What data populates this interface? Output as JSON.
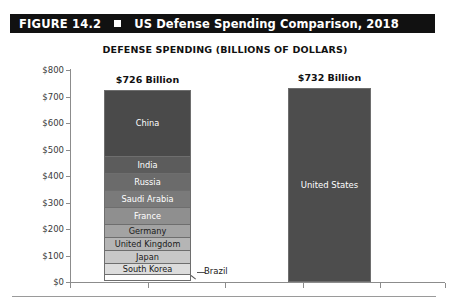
{
  "figure": {
    "number_label": "FIGURE 14.2",
    "bullet_icon": "black-square-bullet",
    "title": "US Defense Spending Comparison, 2018"
  },
  "chart_title": "DEFENSE SPENDING (BILLIONS OF DOLLARS)",
  "axis": {
    "y_ticks": [
      "$800",
      "$700",
      "$600",
      "$500",
      "$400",
      "$300",
      "$200",
      "$100",
      "$0"
    ]
  },
  "bars": {
    "left": {
      "total_label": "$726 Billion"
    },
    "right": {
      "total_label": "$732 Billion"
    }
  },
  "callout": {
    "brazil_label": "Brazil"
  },
  "chart_data": {
    "type": "bar",
    "title": "DEFENSE SPENDING (BILLIONS OF DOLLARS)",
    "subtitle": "US Defense Spending Comparison, 2018",
    "xlabel": "",
    "ylabel": "Billions of dollars",
    "ylim": [
      0,
      800
    ],
    "y_ticks": [
      0,
      100,
      200,
      300,
      400,
      500,
      600,
      700,
      800
    ],
    "grid": false,
    "legend": "none",
    "categories": [
      "Top 9 countries after the US (stacked)",
      "United States"
    ],
    "totals": [
      726,
      732
    ],
    "total_labels": [
      "$726 Billion",
      "$732 Billion"
    ],
    "stacked_bar": {
      "category": "Top 9 countries after the US (stacked)",
      "total": 726,
      "segments": [
        {
          "name": "China",
          "value": 250,
          "color": "#4a4a4a",
          "label_color": "#ffffff"
        },
        {
          "name": "India",
          "value": 66,
          "color": "#5c5c5c",
          "label_color": "#ffffff"
        },
        {
          "name": "Russia",
          "value": 61,
          "color": "#6b6b6b",
          "label_color": "#ffffff"
        },
        {
          "name": "Saudi Arabia",
          "value": 67,
          "color": "#7a7a7a",
          "label_color": "#ffffff"
        },
        {
          "name": "France",
          "value": 63,
          "color": "#8f8f8f",
          "label_color": "#ffffff"
        },
        {
          "name": "Germany",
          "value": 49,
          "color": "#a3a3a3",
          "label_color": "#1a1a1a"
        },
        {
          "name": "United Kingdom",
          "value": 50,
          "color": "#b5b5b5",
          "label_color": "#1a1a1a"
        },
        {
          "name": "Japan",
          "value": 47,
          "color": "#c8c8c8",
          "label_color": "#1a1a1a"
        },
        {
          "name": "South Korea",
          "value": 43,
          "color": "#dcdcdc",
          "label_color": "#1a1a1a"
        },
        {
          "name": "Brazil",
          "value": 28,
          "color": "#fdfdfd",
          "label_color": "#1a1a1a"
        }
      ]
    },
    "single_bar": {
      "category": "United States",
      "name": "United States",
      "value": 732,
      "color": "#4d4d4d",
      "label_color": "#ffffff"
    },
    "annotations": [
      {
        "text": "Brazil",
        "points_to": "bottom segment of stacked bar"
      }
    ]
  }
}
